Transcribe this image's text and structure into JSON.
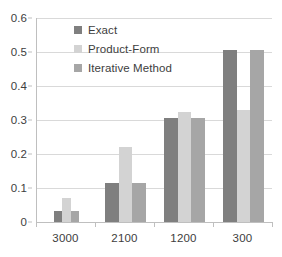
{
  "chart_data": {
    "type": "bar",
    "title": "",
    "subtitle": "",
    "xlabel": "",
    "ylabel": "",
    "categories": [
      "3000",
      "2100",
      "1200",
      "300"
    ],
    "series": [
      {
        "name": "Exact",
        "color": "#7f7f7f",
        "values": [
          0.031,
          0.116,
          0.306,
          0.507
        ]
      },
      {
        "name": "Product-Form",
        "color": "#d3d3d3",
        "values": [
          0.07,
          0.221,
          0.325,
          0.328
        ]
      },
      {
        "name": "Iterative Method",
        "color": "#a6a6a6",
        "values": [
          0.031,
          0.116,
          0.306,
          0.507
        ]
      }
    ],
    "ylim": [
      0,
      0.6
    ],
    "ytick_labels": [
      "0",
      "0.1",
      "0.2",
      "0.3",
      "0.4",
      "0.5",
      "0.6"
    ],
    "ytick_values": [
      0,
      0.1,
      0.2,
      0.3,
      0.4,
      0.5,
      0.6
    ],
    "grid": true,
    "legend_position": "top-left",
    "gridline_color": "#d9d9d9",
    "axis_color": "#bfbfbf",
    "text_color": "#3d3d3d",
    "background": "#ffffff"
  }
}
